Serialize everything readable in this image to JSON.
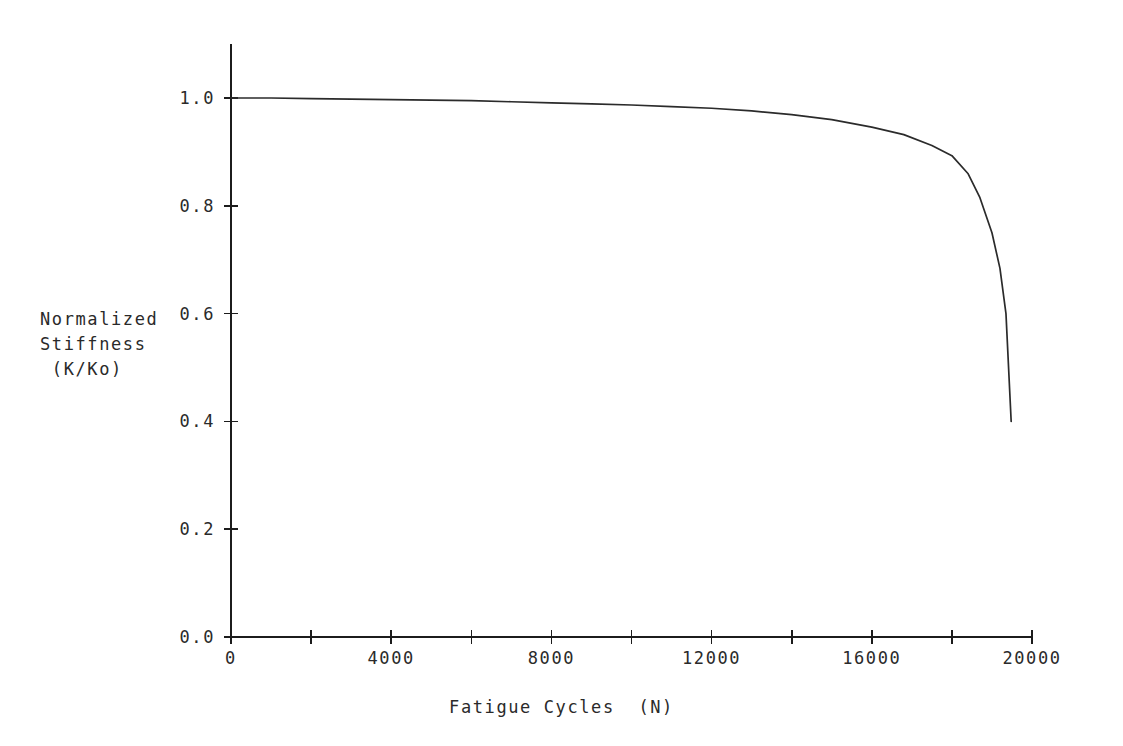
{
  "chart_data": {
    "type": "line",
    "title": "",
    "xlabel": "Fatigue Cycles  (N)",
    "ylabel_lines": [
      "Normalized",
      "Stiffness",
      " (K/Ko)"
    ],
    "ylabel": "Normalized Stiffness (K/Ko)",
    "xlim": [
      0,
      20000
    ],
    "ylim": [
      0.0,
      1.0
    ],
    "grid": false,
    "legend": null,
    "line_color": "#2b2b2b",
    "xticks": [
      0,
      2000,
      4000,
      6000,
      8000,
      10000,
      12000,
      14000,
      16000,
      18000,
      20000
    ],
    "xtick_labels": [
      "0",
      "",
      "4000",
      "",
      "8000",
      "",
      "12000",
      "",
      "16000",
      "",
      "20000"
    ],
    "yticks": [
      0.0,
      0.2,
      0.4,
      0.6,
      0.8,
      1.0
    ],
    "ytick_labels": [
      "0.0",
      "0.2",
      "0.4",
      "0.6",
      "0.8",
      "1.0"
    ],
    "series": [
      {
        "name": "Normalized Stiffness",
        "x": [
          0,
          1000,
          2000,
          3000,
          4000,
          5000,
          6000,
          7000,
          8000,
          9000,
          10000,
          11000,
          12000,
          13000,
          14000,
          15000,
          16000,
          16800,
          17500,
          18000,
          18400,
          18700,
          19000,
          19200,
          19350,
          19480
        ],
        "y": [
          1.0,
          1.0,
          0.999,
          0.998,
          0.997,
          0.996,
          0.995,
          0.993,
          0.991,
          0.989,
          0.987,
          0.984,
          0.981,
          0.976,
          0.969,
          0.96,
          0.946,
          0.932,
          0.912,
          0.893,
          0.86,
          0.815,
          0.75,
          0.684,
          0.6,
          0.4
        ]
      }
    ]
  }
}
